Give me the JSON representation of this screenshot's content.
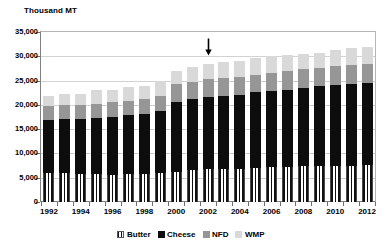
{
  "chart_data": {
    "type": "bar",
    "stacked": true,
    "title": "",
    "ylabel": "Thousand MT",
    "xlabel": "",
    "ylim": [
      0,
      35000
    ],
    "ytick_step": 5000,
    "yticks": [
      "35,000",
      "30,000",
      "25,000",
      "20,000",
      "15,000",
      "10,000",
      "5,000",
      "0"
    ],
    "grid": true,
    "legend_position": "bottom",
    "categories": [
      "1992",
      "1993",
      "1994",
      "1995",
      "1996",
      "1997",
      "1998",
      "1999",
      "2000",
      "2001",
      "2002",
      "2003",
      "2004",
      "2005",
      "2006",
      "2007",
      "2008",
      "2009",
      "2010",
      "2011",
      "2012"
    ],
    "xtick_labels": [
      "1992",
      "",
      "1994",
      "",
      "1996",
      "",
      "1998",
      "",
      "2000",
      "",
      "2002",
      "",
      "2004",
      "",
      "2006",
      "",
      "2008",
      "",
      "2010",
      "",
      "2012"
    ],
    "series": [
      {
        "name": "Butter",
        "color": "#ffffff",
        "pattern": "vertical-stripes",
        "values": [
          6000,
          5950,
          5750,
          5700,
          5650,
          5750,
          5800,
          5900,
          6200,
          6600,
          6750,
          6800,
          6900,
          7000,
          7150,
          7250,
          7350,
          7400,
          7450,
          7500,
          7550
        ]
      },
      {
        "name": "Cheese",
        "color": "#0d0d0d",
        "values": [
          10800,
          11200,
          11350,
          11550,
          11900,
          12100,
          12400,
          12800,
          14450,
          14650,
          14950,
          15100,
          15200,
          15600,
          15750,
          15900,
          16150,
          16400,
          16550,
          16800,
          17050
        ]
      },
      {
        "name": "NFD",
        "color": "#969696",
        "values": [
          3000,
          2800,
          2850,
          3000,
          3100,
          3000,
          3000,
          3100,
          3650,
          3500,
          3600,
          3550,
          3700,
          3650,
          3650,
          3800,
          3850,
          3800,
          4100,
          3950,
          3900
        ]
      },
      {
        "name": "WMP",
        "color": "#d9d9d9",
        "values": [
          1950,
          2350,
          2300,
          2800,
          2350,
          2750,
          2600,
          3100,
          2650,
          3000,
          3050,
          3300,
          3250,
          3350,
          3500,
          3400,
          3100,
          3050,
          3100,
          3400,
          3400
        ]
      }
    ],
    "totals": [
      21750,
      22300,
      22250,
      23050,
      23000,
      23600,
      23800,
      24900,
      26950,
      27750,
      28350,
      28750,
      29050,
      29600,
      30050,
      30350,
      30450,
      30650,
      31200,
      31650,
      31900
    ],
    "annotations": [
      {
        "name": "down-arrow",
        "glyph": "arrow-down",
        "at_category": "2002"
      }
    ]
  },
  "legend": {
    "items": [
      {
        "label": "Butter",
        "swatch": "butter-swatch"
      },
      {
        "label": "Cheese",
        "swatch": "cheese-swatch"
      },
      {
        "label": "NFD",
        "swatch": "nfd-swatch"
      },
      {
        "label": "WMP",
        "swatch": "wmp-swatch"
      }
    ]
  }
}
